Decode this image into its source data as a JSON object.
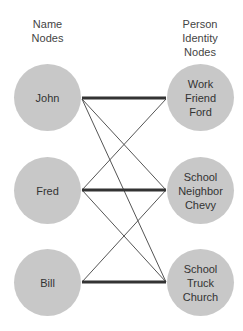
{
  "headers": {
    "left": [
      "Name",
      "Nodes"
    ],
    "right": [
      "Person",
      "Identity",
      "Nodes"
    ]
  },
  "name_nodes": [
    {
      "id": "john",
      "label": "John"
    },
    {
      "id": "fred",
      "label": "Fred"
    },
    {
      "id": "bill",
      "label": "Bill"
    }
  ],
  "identity_nodes": [
    {
      "id": "ford",
      "lines": [
        "Work",
        "Friend",
        "Ford"
      ]
    },
    {
      "id": "chevy",
      "lines": [
        "School",
        "Neighbor",
        "Chevy"
      ]
    },
    {
      "id": "church",
      "lines": [
        "School",
        "Truck",
        "Church"
      ]
    }
  ],
  "edges": [
    {
      "from": "john",
      "to": "ford",
      "weight": "thick"
    },
    {
      "from": "john",
      "to": "chevy",
      "weight": "thin"
    },
    {
      "from": "john",
      "to": "church",
      "weight": "thin"
    },
    {
      "from": "fred",
      "to": "ford",
      "weight": "thin"
    },
    {
      "from": "fred",
      "to": "chevy",
      "weight": "thick"
    },
    {
      "from": "fred",
      "to": "church",
      "weight": "thin"
    },
    {
      "from": "bill",
      "to": "chevy",
      "weight": "thin"
    },
    {
      "from": "bill",
      "to": "church",
      "weight": "thick"
    }
  ],
  "colors": {
    "node_fill": "#c8c8c8",
    "thin_edge": "#555555",
    "thick_edge": "#333333"
  }
}
